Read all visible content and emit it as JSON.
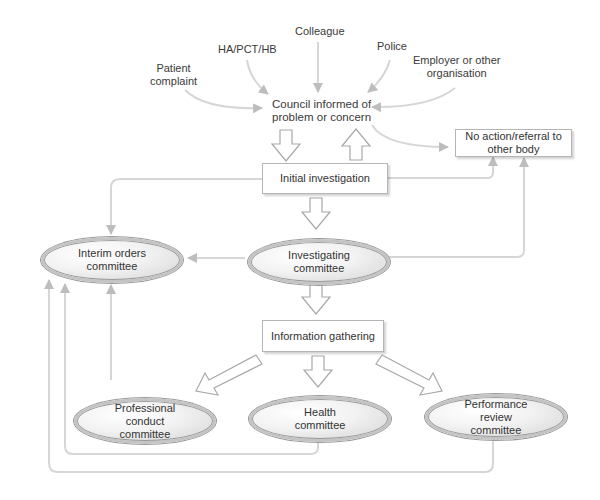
{
  "sources": {
    "patient_complaint": "Patient\ncomplaint",
    "ha_pct_hb": "HA/PCT/HB",
    "colleague": "Colleague",
    "police": "Police",
    "employer": "Employer or other\norganisation"
  },
  "nodes": {
    "council": "Council informed of\nproblem or concern",
    "no_action": "No action/referral to\nother body",
    "initial_investigation": "Initial investigation",
    "interim_orders": "Interim orders\ncommittee",
    "investigating": "Investigating\ncommittee",
    "information_gathering": "Information gathering",
    "professional_conduct": "Professional\nconduct\ncommittee",
    "health": "Health\ncommittee",
    "performance_review": "Performance\nreview\ncommittee"
  },
  "colors": {
    "line": "#d0d0d0",
    "arrowhead": "#bdbdbd",
    "box_border": "#b5b5b5",
    "ellipse_border": "#c4c4c4",
    "text": "#333333"
  }
}
